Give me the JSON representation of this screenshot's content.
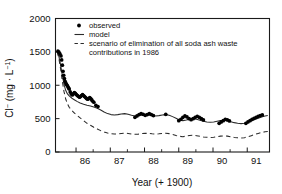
{
  "chart_data": {
    "type": "scatter",
    "title": "",
    "xlabel": "Year (+ 1900)",
    "ylabel": "Cl- (mg · L-1)",
    "ylabel_parts": {
      "species": "Cl",
      "species_sup": "−",
      "unit_open": " (mg · L",
      "unit_sup": "−1",
      "unit_close": ")"
    },
    "xlim": [
      85.4,
      91.65
    ],
    "ylim": [
      0,
      2000
    ],
    "yticks": [
      0,
      500,
      1000,
      1500,
      2000
    ],
    "ytick_labels": [
      "0",
      "500",
      "1000",
      "1500",
      "2000"
    ],
    "xticks": [
      86,
      87,
      88,
      89,
      90,
      91
    ],
    "xtick_labels": [
      "86",
      "87",
      "88",
      "89",
      "90",
      "91"
    ],
    "xminor_ticks": [
      86.5,
      87.5,
      88.5,
      89.5,
      90.5
    ],
    "grid": false,
    "legend_position": "top-left-inside",
    "legend": [
      {
        "label": "observed",
        "marker": "dot"
      },
      {
        "label": "model",
        "marker": "solid-line"
      },
      {
        "label": "scenario of elimination of all soda ash waste",
        "marker": "dashed-line"
      },
      {
        "label": "contributions in 1986",
        "marker": "none"
      }
    ],
    "series": [
      {
        "name": "observed",
        "style": "dot",
        "points": [
          [
            85.47,
            1510
          ],
          [
            85.5,
            1495
          ],
          [
            85.53,
            1470
          ],
          [
            85.56,
            1440
          ],
          [
            85.58,
            1380
          ],
          [
            85.6,
            1300
          ],
          [
            85.62,
            1210
          ],
          [
            85.64,
            1150
          ],
          [
            85.66,
            1100
          ],
          [
            85.68,
            1060
          ],
          [
            85.7,
            1035
          ],
          [
            85.72,
            1015
          ],
          [
            85.74,
            1000
          ],
          [
            85.76,
            980
          ],
          [
            85.78,
            960
          ],
          [
            85.8,
            945
          ],
          [
            85.83,
            900
          ],
          [
            85.86,
            870
          ],
          [
            85.89,
            855
          ],
          [
            85.92,
            870
          ],
          [
            85.95,
            890
          ],
          [
            85.98,
            880
          ],
          [
            86.01,
            860
          ],
          [
            86.04,
            845
          ],
          [
            86.07,
            835
          ],
          [
            86.1,
            820
          ],
          [
            86.13,
            830
          ],
          [
            86.16,
            845
          ],
          [
            86.19,
            860
          ],
          [
            86.22,
            845
          ],
          [
            86.25,
            830
          ],
          [
            86.28,
            815
          ],
          [
            86.31,
            800
          ],
          [
            86.34,
            790
          ],
          [
            86.37,
            800
          ],
          [
            86.4,
            815
          ],
          [
            86.43,
            800
          ],
          [
            86.46,
            780
          ],
          [
            86.49,
            760
          ],
          [
            86.52,
            745
          ],
          [
            86.58,
            700
          ],
          [
            86.64,
            680
          ],
          [
            87.72,
            520
          ],
          [
            87.78,
            540
          ],
          [
            87.84,
            560
          ],
          [
            87.9,
            575
          ],
          [
            87.96,
            565
          ],
          [
            88.02,
            550
          ],
          [
            88.08,
            560
          ],
          [
            88.14,
            575
          ],
          [
            88.2,
            560
          ],
          [
            88.26,
            545
          ],
          [
            88.62,
            565
          ],
          [
            89.0,
            470
          ],
          [
            89.06,
            490
          ],
          [
            89.12,
            520
          ],
          [
            89.18,
            540
          ],
          [
            89.24,
            525
          ],
          [
            89.3,
            500
          ],
          [
            89.36,
            485
          ],
          [
            89.42,
            500
          ],
          [
            89.48,
            520
          ],
          [
            89.54,
            535
          ],
          [
            89.6,
            520
          ],
          [
            89.66,
            500
          ],
          [
            89.72,
            480
          ],
          [
            90.18,
            430
          ],
          [
            90.24,
            450
          ],
          [
            90.3,
            470
          ],
          [
            90.36,
            490
          ],
          [
            90.42,
            480
          ],
          [
            90.48,
            465
          ],
          [
            90.96,
            430
          ],
          [
            91.02,
            450
          ],
          [
            91.08,
            470
          ],
          [
            91.14,
            490
          ],
          [
            91.2,
            505
          ],
          [
            91.26,
            520
          ],
          [
            91.32,
            535
          ],
          [
            91.38,
            545
          ],
          [
            91.44,
            555
          ]
        ]
      },
      {
        "name": "model",
        "style": "solid",
        "points": [
          [
            85.45,
            1500
          ],
          [
            85.5,
            1430
          ],
          [
            85.55,
            1300
          ],
          [
            85.6,
            1150
          ],
          [
            85.65,
            1010
          ],
          [
            85.7,
            920
          ],
          [
            85.75,
            870
          ],
          [
            85.8,
            840
          ],
          [
            85.88,
            805
          ],
          [
            85.96,
            780
          ],
          [
            86.04,
            755
          ],
          [
            86.12,
            735
          ],
          [
            86.22,
            715
          ],
          [
            86.32,
            700
          ],
          [
            86.42,
            690
          ],
          [
            86.52,
            675
          ],
          [
            86.62,
            655
          ],
          [
            86.72,
            630
          ],
          [
            86.82,
            600
          ],
          [
            86.92,
            575
          ],
          [
            87.02,
            560
          ],
          [
            87.12,
            555
          ],
          [
            87.22,
            560
          ],
          [
            87.32,
            570
          ],
          [
            87.42,
            575
          ],
          [
            87.52,
            565
          ],
          [
            87.62,
            550
          ],
          [
            87.72,
            540
          ],
          [
            87.82,
            545
          ],
          [
            87.92,
            555
          ],
          [
            88.02,
            560
          ],
          [
            88.12,
            555
          ],
          [
            88.22,
            545
          ],
          [
            88.32,
            540
          ],
          [
            88.42,
            545
          ],
          [
            88.52,
            555
          ],
          [
            88.62,
            560
          ],
          [
            88.72,
            550
          ],
          [
            88.82,
            530
          ],
          [
            88.92,
            505
          ],
          [
            89.02,
            480
          ],
          [
            89.12,
            470
          ],
          [
            89.22,
            480
          ],
          [
            89.32,
            495
          ],
          [
            89.42,
            500
          ],
          [
            89.52,
            490
          ],
          [
            89.62,
            475
          ],
          [
            89.72,
            460
          ],
          [
            89.82,
            450
          ],
          [
            89.92,
            445
          ],
          [
            90.02,
            450
          ],
          [
            90.12,
            460
          ],
          [
            90.22,
            470
          ],
          [
            90.32,
            475
          ],
          [
            90.42,
            470
          ],
          [
            90.52,
            455
          ],
          [
            90.62,
            440
          ],
          [
            90.72,
            430
          ],
          [
            90.82,
            425
          ],
          [
            90.92,
            430
          ],
          [
            91.02,
            445
          ],
          [
            91.12,
            465
          ],
          [
            91.22,
            485
          ],
          [
            91.32,
            505
          ],
          [
            91.42,
            525
          ],
          [
            91.52,
            540
          ],
          [
            91.6,
            548
          ]
        ]
      },
      {
        "name": "scenario of elimination of all soda ash waste contributions in 1986",
        "style": "dashed",
        "points": [
          [
            85.45,
            1500
          ],
          [
            85.5,
            1400
          ],
          [
            85.55,
            1240
          ],
          [
            85.6,
            1060
          ],
          [
            85.65,
            900
          ],
          [
            85.7,
            790
          ],
          [
            85.75,
            720
          ],
          [
            85.8,
            670
          ],
          [
            85.88,
            620
          ],
          [
            85.96,
            580
          ],
          [
            86.04,
            545
          ],
          [
            86.12,
            510
          ],
          [
            86.22,
            470
          ],
          [
            86.32,
            430
          ],
          [
            86.42,
            400
          ],
          [
            86.52,
            370
          ],
          [
            86.62,
            345
          ],
          [
            86.72,
            320
          ],
          [
            86.82,
            300
          ],
          [
            86.92,
            285
          ],
          [
            87.02,
            275
          ],
          [
            87.12,
            270
          ],
          [
            87.22,
            272
          ],
          [
            87.32,
            278
          ],
          [
            87.42,
            282
          ],
          [
            87.52,
            278
          ],
          [
            87.62,
            270
          ],
          [
            87.72,
            265
          ],
          [
            87.82,
            268
          ],
          [
            87.92,
            275
          ],
          [
            88.02,
            280
          ],
          [
            88.12,
            278
          ],
          [
            88.22,
            272
          ],
          [
            88.32,
            268
          ],
          [
            88.42,
            272
          ],
          [
            88.52,
            278
          ],
          [
            88.62,
            282
          ],
          [
            88.72,
            275
          ],
          [
            88.82,
            262
          ],
          [
            88.92,
            248
          ],
          [
            89.02,
            235
          ],
          [
            89.12,
            230
          ],
          [
            89.22,
            238
          ],
          [
            89.32,
            248
          ],
          [
            89.42,
            252
          ],
          [
            89.52,
            245
          ],
          [
            89.62,
            235
          ],
          [
            89.72,
            225
          ],
          [
            89.82,
            220
          ],
          [
            89.92,
            218
          ],
          [
            90.02,
            222
          ],
          [
            90.12,
            230
          ],
          [
            90.22,
            238
          ],
          [
            90.32,
            242
          ],
          [
            90.42,
            238
          ],
          [
            90.52,
            228
          ],
          [
            90.62,
            218
          ],
          [
            90.72,
            212
          ],
          [
            90.82,
            210
          ],
          [
            90.92,
            215
          ],
          [
            91.02,
            228
          ],
          [
            91.12,
            245
          ],
          [
            91.22,
            262
          ],
          [
            91.32,
            278
          ],
          [
            91.42,
            292
          ],
          [
            91.52,
            302
          ],
          [
            91.6,
            308
          ]
        ]
      }
    ]
  }
}
